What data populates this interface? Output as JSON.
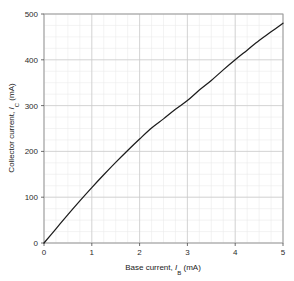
{
  "chart_data": {
    "type": "line",
    "title": "",
    "xlabel": "Base current, I_B (mA)",
    "ylabel": "Collector current, I_C (mA)",
    "xlabel_parts": {
      "prefix": "Base current, ",
      "symbol": "I",
      "subscript": "B",
      "suffix": " (mA)"
    },
    "ylabel_parts": {
      "prefix": "Collector current, ",
      "symbol": "I",
      "subscript": "C",
      "suffix": " (mA)"
    },
    "xlim": [
      0,
      5
    ],
    "ylim": [
      0,
      500
    ],
    "xticks": [
      0,
      1,
      2,
      3,
      4,
      5
    ],
    "yticks": [
      0,
      100,
      200,
      300,
      400,
      500
    ],
    "xtick_labels": [
      "0",
      "1",
      "2",
      "3",
      "4",
      "5"
    ],
    "ytick_labels": [
      "0",
      "100",
      "200",
      "300",
      "400",
      "500"
    ],
    "x_minor_step": 0.25,
    "y_minor_step": 25,
    "grid": true,
    "grid_major": true,
    "grid_minor": true,
    "legend": "none",
    "series": [
      {
        "name": "Transfer characteristic",
        "color": "#1c1c1c",
        "x": [
          0,
          0.25,
          0.5,
          0.75,
          1.0,
          1.25,
          1.5,
          1.75,
          2.0,
          2.25,
          2.5,
          2.75,
          3.0,
          3.25,
          3.5,
          3.75,
          4.0,
          4.25,
          4.5,
          4.75,
          5.0
        ],
        "y": [
          0,
          31,
          62,
          92,
          121,
          149,
          176,
          202,
          227,
          251,
          271,
          292,
          311,
          334,
          355,
          378,
          400,
          421,
          442,
          461,
          480
        ]
      }
    ],
    "colors": {
      "curve": "#1c1c1c",
      "grid_major": "#c9c9c9",
      "grid_minor": "#e9e9e9",
      "frame": "#9a9a9a",
      "text": "#1a1a1a",
      "background": "#ffffff"
    },
    "plot_box": {
      "left": 44,
      "top": 14,
      "right": 283,
      "bottom": 243
    }
  }
}
